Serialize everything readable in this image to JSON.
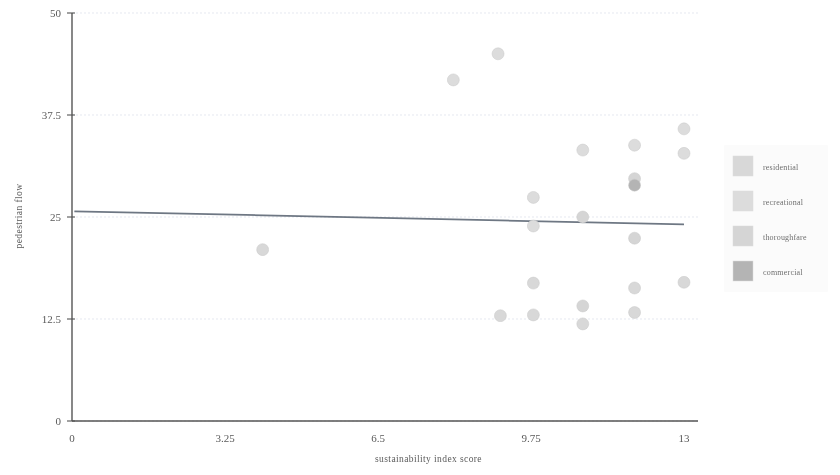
{
  "chart_data": {
    "type": "scatter",
    "title": "",
    "xlabel": "sustainability index score",
    "ylabel": "pedestrian flow",
    "xlim": [
      0,
      13
    ],
    "ylim": [
      0,
      50
    ],
    "xticks": [
      "0",
      "3.25",
      "6.5",
      "9.75",
      "13"
    ],
    "xtick_values": [
      0,
      3.25,
      6.5,
      9.75,
      13
    ],
    "yticks": [
      "0",
      "12.5",
      "25",
      "37.5",
      "50"
    ],
    "ytick_values": [
      0,
      12.5,
      25,
      37.5,
      50
    ],
    "grid": true,
    "legend_position": "right",
    "marker": "circle",
    "marker_size": 11,
    "trendline": {
      "visible": true,
      "x_start": 0.05,
      "y_start": 25.7,
      "x_end": 13.0,
      "y_end": 24.1
    },
    "series": [
      {
        "name": "residential",
        "color": "#d8d8d8",
        "points": [
          {
            "x": 4.05,
            "y": 21.0
          },
          {
            "x": 9.1,
            "y": 12.9
          },
          {
            "x": 9.8,
            "y": 13.0
          },
          {
            "x": 9.8,
            "y": 16.9
          },
          {
            "x": 10.85,
            "y": 11.9
          },
          {
            "x": 11.95,
            "y": 13.3
          },
          {
            "x": 11.95,
            "y": 16.3
          },
          {
            "x": 13.0,
            "y": 17.0
          }
        ]
      },
      {
        "name": "recreational",
        "color": "#dcdcdc",
        "points": [
          {
            "x": 8.1,
            "y": 41.8
          },
          {
            "x": 9.05,
            "y": 45.0
          },
          {
            "x": 9.8,
            "y": 27.4
          },
          {
            "x": 9.8,
            "y": 23.9
          },
          {
            "x": 10.85,
            "y": 33.2
          },
          {
            "x": 11.95,
            "y": 33.8
          },
          {
            "x": 13.0,
            "y": 35.8
          },
          {
            "x": 13.0,
            "y": 32.8
          }
        ]
      },
      {
        "name": "thoroughfare",
        "color": "#d5d5d5",
        "points": [
          {
            "x": 10.85,
            "y": 25.0
          },
          {
            "x": 10.85,
            "y": 14.1
          },
          {
            "x": 11.95,
            "y": 22.4
          },
          {
            "x": 11.95,
            "y": 29.7
          }
        ]
      },
      {
        "name": "commercial",
        "color": "#b4b4b4",
        "points": [
          {
            "x": 11.95,
            "y": 28.9
          }
        ]
      }
    ],
    "legend": [
      {
        "label": "residential",
        "color": "#d8d8d8"
      },
      {
        "label": "recreational",
        "color": "#dcdcdc"
      },
      {
        "label": "thoroughfare",
        "color": "#d5d5d5"
      },
      {
        "label": "commercial",
        "color": "#b4b4b4"
      }
    ]
  }
}
